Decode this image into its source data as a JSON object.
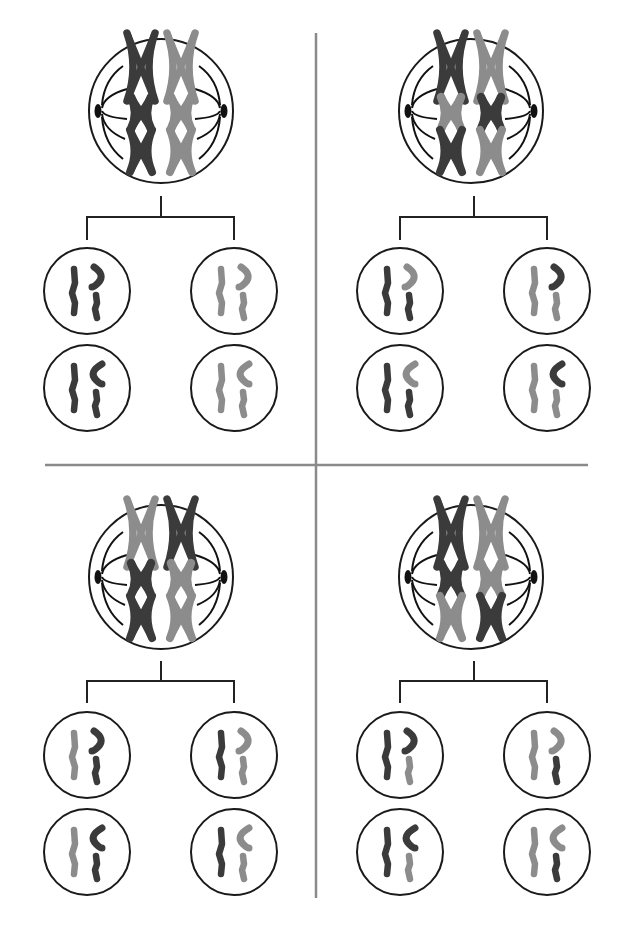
{
  "title": "Meiosis: independent assortment of homologous chromosomes",
  "colors": {
    "dark": "#3b3b3b",
    "light": "#8c8c8c",
    "outline": "#1a1a1a",
    "divider": "#8a8a8a",
    "background": "#ffffff"
  },
  "dividers": {
    "vertical": {
      "x": 316,
      "y1": 33,
      "y2": 898
    },
    "horizontal": {
      "y": 465,
      "x1": 45,
      "x2": 588
    }
  },
  "quadrants": [
    {
      "id": "top-left",
      "label": "Arrangement 1",
      "parent": {
        "cx": 161,
        "cy": 111,
        "r": 72,
        "rows": [
          {
            "size": "large",
            "left": "dark",
            "right": "light"
          },
          {
            "size": "small",
            "left": "dark",
            "right": "light"
          },
          {
            "size": "medium",
            "left": "dark",
            "right": "light"
          }
        ]
      },
      "bracket": {
        "stem_x": 161,
        "stem_y1": 196,
        "bar_y": 217,
        "left_x": 87,
        "right_x": 234,
        "drop_y": 240
      },
      "daughters": [
        {
          "cx": 87,
          "cy": 291,
          "hook_dir": "right",
          "long": "dark",
          "hook": "dark",
          "short": "dark"
        },
        {
          "cx": 234,
          "cy": 291,
          "hook_dir": "right",
          "long": "light",
          "hook": "light",
          "short": "light"
        },
        {
          "cx": 87,
          "cy": 388,
          "hook_dir": "left",
          "long": "dark",
          "hook": "dark",
          "short": "dark"
        },
        {
          "cx": 234,
          "cy": 388,
          "hook_dir": "left",
          "long": "light",
          "hook": "light",
          "short": "light"
        }
      ]
    },
    {
      "id": "top-right",
      "label": "Arrangement 2",
      "parent": {
        "cx": 471,
        "cy": 111,
        "r": 72,
        "rows": [
          {
            "size": "large",
            "left": "dark",
            "right": "light"
          },
          {
            "size": "small",
            "left": "light",
            "right": "dark"
          },
          {
            "size": "medium",
            "left": "dark",
            "right": "light"
          }
        ]
      },
      "bracket": {
        "stem_x": 474,
        "stem_y1": 196,
        "bar_y": 217,
        "left_x": 400,
        "right_x": 547,
        "drop_y": 240
      },
      "daughters": [
        {
          "cx": 400,
          "cy": 291,
          "hook_dir": "right",
          "long": "dark",
          "hook": "light",
          "short": "dark"
        },
        {
          "cx": 547,
          "cy": 291,
          "hook_dir": "right",
          "long": "light",
          "hook": "dark",
          "short": "light"
        },
        {
          "cx": 400,
          "cy": 388,
          "hook_dir": "left",
          "long": "dark",
          "hook": "light",
          "short": "dark"
        },
        {
          "cx": 547,
          "cy": 388,
          "hook_dir": "left",
          "long": "light",
          "hook": "dark",
          "short": "light"
        }
      ]
    },
    {
      "id": "bottom-left",
      "label": "Arrangement 3",
      "parent": {
        "cx": 161,
        "cy": 577,
        "r": 72,
        "rows": [
          {
            "size": "large",
            "left": "light",
            "right": "dark"
          },
          {
            "size": "small",
            "left": "dark",
            "right": "light"
          },
          {
            "size": "medium",
            "left": "dark",
            "right": "light"
          }
        ]
      },
      "bracket": {
        "stem_x": 161,
        "stem_y1": 661,
        "bar_y": 681,
        "left_x": 87,
        "right_x": 234,
        "drop_y": 703
      },
      "daughters": [
        {
          "cx": 87,
          "cy": 755,
          "hook_dir": "right",
          "long": "light",
          "hook": "dark",
          "short": "dark"
        },
        {
          "cx": 234,
          "cy": 755,
          "hook_dir": "right",
          "long": "dark",
          "hook": "light",
          "short": "light"
        },
        {
          "cx": 87,
          "cy": 852,
          "hook_dir": "left",
          "long": "light",
          "hook": "dark",
          "short": "dark"
        },
        {
          "cx": 234,
          "cy": 852,
          "hook_dir": "left",
          "long": "dark",
          "hook": "light",
          "short": "light"
        }
      ]
    },
    {
      "id": "bottom-right",
      "label": "Arrangement 4",
      "parent": {
        "cx": 471,
        "cy": 577,
        "r": 72,
        "rows": [
          {
            "size": "large",
            "left": "dark",
            "right": "light"
          },
          {
            "size": "small",
            "left": "dark",
            "right": "light"
          },
          {
            "size": "medium",
            "left": "light",
            "right": "dark"
          }
        ]
      },
      "bracket": {
        "stem_x": 474,
        "stem_y1": 661,
        "bar_y": 681,
        "left_x": 400,
        "right_x": 547,
        "drop_y": 703
      },
      "daughters": [
        {
          "cx": 400,
          "cy": 755,
          "hook_dir": "right",
          "long": "dark",
          "hook": "dark",
          "short": "light"
        },
        {
          "cx": 547,
          "cy": 755,
          "hook_dir": "right",
          "long": "light",
          "hook": "light",
          "short": "dark"
        },
        {
          "cx": 400,
          "cy": 852,
          "hook_dir": "left",
          "long": "dark",
          "hook": "dark",
          "short": "light"
        },
        {
          "cx": 547,
          "cy": 852,
          "hook_dir": "left",
          "long": "light",
          "hook": "light",
          "short": "dark"
        }
      ]
    }
  ]
}
